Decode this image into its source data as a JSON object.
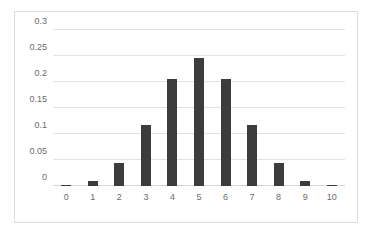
{
  "chart_data": {
    "type": "bar",
    "title": "",
    "subtitle": "",
    "xlabel": "",
    "ylabel": "",
    "categories": [
      "0",
      "1",
      "2",
      "3",
      "4",
      "5",
      "6",
      "7",
      "8",
      "9",
      "10"
    ],
    "values": [
      0.001,
      0.0098,
      0.0439,
      0.1172,
      0.2051,
      0.2461,
      0.2051,
      0.1172,
      0.0439,
      0.0098,
      0.001
    ],
    "series": [
      {
        "name": "Probability",
        "values": [
          0.001,
          0.0098,
          0.0439,
          0.1172,
          0.2051,
          0.2461,
          0.2051,
          0.1172,
          0.0439,
          0.0098,
          0.001
        ]
      }
    ],
    "ylim": [
      0,
      0.3
    ],
    "yticks": [
      0,
      0.05,
      0.1,
      0.15,
      0.2,
      0.25,
      0.3
    ],
    "ytick_labels": [
      "0",
      "0.05",
      "0.1",
      "0.15",
      "0.2",
      "0.25",
      "0.3"
    ],
    "xtick_labels": [
      "0",
      "1",
      "2",
      "3",
      "4",
      "5",
      "6",
      "7",
      "8",
      "9",
      "10"
    ],
    "grid": true,
    "grid_axis": "y",
    "legend": false,
    "legend_position": "none",
    "bar_color": "#3c3c3c",
    "gridline_color": "#e3e3e3",
    "axis_text_color": "#6b6b6b",
    "plot_background": "#ffffff",
    "border_color": "#dcdcdc",
    "annotations": []
  }
}
